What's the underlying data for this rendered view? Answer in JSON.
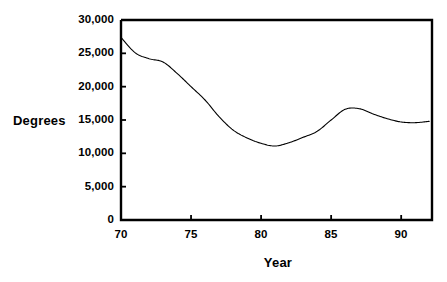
{
  "chart_data": {
    "type": "line",
    "title": "",
    "xlabel": "Year",
    "ylabel": "Degrees",
    "xlim": [
      70,
      92.2
    ],
    "ylim": [
      0,
      30000
    ],
    "grid": false,
    "legend": null,
    "x_ticks": [
      70,
      75,
      80,
      85,
      90
    ],
    "x_tick_labels": [
      "70",
      "75",
      "80",
      "85",
      "90"
    ],
    "y_ticks": [
      0,
      5000,
      10000,
      15000,
      20000,
      25000,
      30000
    ],
    "y_tick_labels": [
      "0",
      "5,000",
      "10,000",
      "15,000",
      "20,000",
      "25,000",
      "30,000"
    ],
    "line_color": "#000000",
    "x": [
      70,
      71,
      72,
      73,
      74,
      75,
      76,
      77,
      78,
      79,
      80,
      81,
      82,
      83,
      84,
      85,
      86,
      87,
      88,
      89,
      90,
      91,
      92
    ],
    "values": [
      27400,
      25100,
      24200,
      23700,
      22000,
      20000,
      18000,
      15500,
      13500,
      12300,
      11500,
      11100,
      11600,
      12400,
      13300,
      15000,
      16600,
      16700,
      15900,
      15200,
      14700,
      14600,
      14800
    ],
    "series": [
      {
        "name": "Degrees",
        "values": [
          27400,
          25100,
          24200,
          23700,
          22000,
          20000,
          18000,
          15500,
          13500,
          12300,
          11500,
          11100,
          11600,
          12400,
          13300,
          15000,
          16600,
          16700,
          15900,
          15200,
          14700,
          14600,
          14800
        ]
      }
    ]
  },
  "axes": {
    "y_title": "Degrees",
    "x_title": "Year"
  }
}
